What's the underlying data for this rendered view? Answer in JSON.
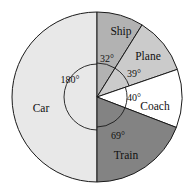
{
  "chart_data": {
    "type": "pie",
    "title": "",
    "subtitle": "",
    "xlabel": "",
    "ylabel": "",
    "legend_position": "none",
    "grid": false,
    "units": "degrees",
    "total_degrees": 360,
    "start_angle_deg": 0,
    "direction": "clockwise",
    "categories": [
      "Ship",
      "Plane",
      "Coach",
      "Train",
      "Car"
    ],
    "values": [
      32,
      39,
      40,
      69,
      180
    ],
    "slices": [
      {
        "label": "Ship",
        "angle_deg": 32,
        "angle_text": "32°",
        "color": "#b2b2b2",
        "start_deg": 0,
        "end_deg": 32
      },
      {
        "label": "Plane",
        "angle_deg": 39,
        "angle_text": "39°",
        "color": "#cbcbcb",
        "start_deg": 32,
        "end_deg": 71
      },
      {
        "label": "Coach",
        "angle_deg": 40,
        "angle_text": "40°",
        "color": "#ffffff",
        "start_deg": 71,
        "end_deg": 111
      },
      {
        "label": "Train",
        "angle_deg": 69,
        "angle_text": "69°",
        "color": "#838383",
        "start_deg": 111,
        "end_deg": 180
      },
      {
        "label": "Car",
        "angle_deg": 180,
        "angle_text": "180°",
        "color": "#e8e8e8",
        "start_deg": 180,
        "end_deg": 360
      }
    ],
    "colors": {
      "ship": "#b2b2b2",
      "plane": "#cbcbcb",
      "coach": "#ffffff",
      "train": "#838383",
      "car": "#e8e8e8",
      "outline": "#1a1a1a",
      "background": "#ffffff"
    }
  },
  "labels": {
    "ship": "Ship",
    "plane": "Plane",
    "coach": "Coach",
    "train": "Train",
    "car": "Car"
  },
  "angle_labels": {
    "ship": "32°",
    "plane": "39°",
    "coach": "40°",
    "train": "69°",
    "car": "180°"
  }
}
